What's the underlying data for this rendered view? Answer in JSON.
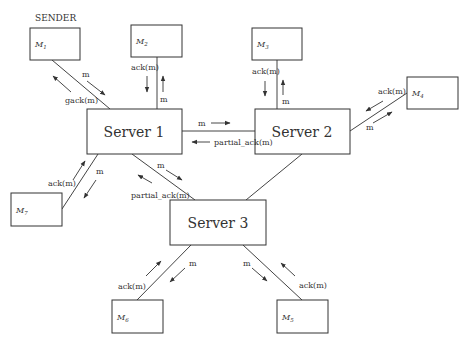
{
  "diagram": {
    "sender_label": "SENDER",
    "servers": [
      {
        "id": "s1",
        "label": "Server 1"
      },
      {
        "id": "s2",
        "label": "Server 2"
      },
      {
        "id": "s3",
        "label": "Server 3"
      }
    ],
    "members": [
      {
        "id": "m1",
        "base": "M",
        "sub": "1"
      },
      {
        "id": "m2",
        "base": "M",
        "sub": "2"
      },
      {
        "id": "m3",
        "base": "M",
        "sub": "3"
      },
      {
        "id": "m4",
        "base": "M",
        "sub": "4"
      },
      {
        "id": "m5",
        "base": "M",
        "sub": "5"
      },
      {
        "id": "m6",
        "base": "M",
        "sub": "6"
      },
      {
        "id": "m7",
        "base": "M",
        "sub": "7"
      }
    ],
    "messages": {
      "m1_s1_forward": "m",
      "m1_s1_back": "gack(m)",
      "m2_s1_forward": "m",
      "m2_s1_back": "ack(m)",
      "m3_s2_forward": "m",
      "m3_s2_back": "ack(m)",
      "m4_s2_forward": "m",
      "m4_s2_back": "ack(m)",
      "s1_s2_forward": "m",
      "s1_s2_back": "partial_ack(m)",
      "s1_s3_forward": "m",
      "s1_s3_back": "partial_ack(m)",
      "s1_m7_forward": "m",
      "s1_m7_back": "ack(m)",
      "s3_m6_forward": "m",
      "s3_m6_back": "ack(m)",
      "s3_m5_forward": "m",
      "s3_m5_back": "ack(m)"
    }
  }
}
